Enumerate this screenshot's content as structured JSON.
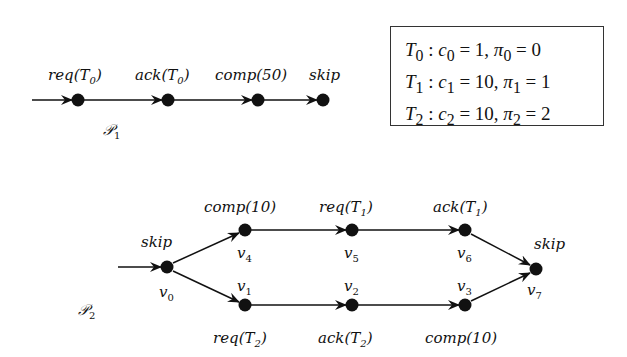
{
  "p1": {
    "title": "P",
    "title_sub": "1",
    "nodes": [
      {
        "id": "n0",
        "x": 78,
        "y": 100,
        "label": "req(T",
        "label_sub": "0",
        "label_end": ")"
      },
      {
        "id": "n1",
        "x": 168,
        "y": 100,
        "label": "ack(T",
        "label_sub": "0",
        "label_end": ")"
      },
      {
        "id": "n2",
        "x": 258,
        "y": 100,
        "label": "comp(50)",
        "label_sub": "",
        "label_end": ""
      },
      {
        "id": "n3",
        "x": 323,
        "y": 100,
        "label": "skip",
        "label_sub": "",
        "label_end": ""
      }
    ],
    "edges": [
      [
        "start",
        "n0"
      ],
      [
        "n0",
        "n1"
      ],
      [
        "n1",
        "n2"
      ],
      [
        "n2",
        "n3"
      ]
    ]
  },
  "legend": {
    "lines": [
      {
        "task": "T",
        "task_sub": "0",
        "c": "c",
        "c_sub": "0",
        "c_val": "1",
        "pi_sub": "0",
        "pi_val": "0"
      },
      {
        "task": "T",
        "task_sub": "1",
        "c": "c",
        "c_sub": "1",
        "c_val": "10",
        "pi_sub": "1",
        "pi_val": "1"
      },
      {
        "task": "T",
        "task_sub": "2",
        "c": "c",
        "c_sub": "2",
        "c_val": "10",
        "pi_sub": "2",
        "pi_val": "2"
      }
    ]
  },
  "p2": {
    "title": "P",
    "title_sub": "2",
    "nodes": [
      {
        "id": "v0",
        "x": 167,
        "y": 267,
        "name": "v",
        "name_sub": "0",
        "action": "skip"
      },
      {
        "id": "v4",
        "x": 245,
        "y": 230,
        "name": "v",
        "name_sub": "4",
        "action": "comp(10)"
      },
      {
        "id": "v5",
        "x": 352,
        "y": 230,
        "name": "v",
        "name_sub": "5",
        "action": "req(T1)"
      },
      {
        "id": "v6",
        "x": 465,
        "y": 230,
        "name": "v",
        "name_sub": "6",
        "action": "ack(T1)"
      },
      {
        "id": "v1",
        "x": 245,
        "y": 305,
        "name": "v",
        "name_sub": "1",
        "action": "req(T2)"
      },
      {
        "id": "v2",
        "x": 352,
        "y": 305,
        "name": "v",
        "name_sub": "2",
        "action": "ack(T2)"
      },
      {
        "id": "v3",
        "x": 465,
        "y": 305,
        "name": "v",
        "name_sub": "3",
        "action": "comp(10)"
      },
      {
        "id": "v7",
        "x": 536,
        "y": 269,
        "name": "v",
        "name_sub": "7",
        "action": "skip"
      }
    ],
    "edges": [
      [
        "start",
        "v0"
      ],
      [
        "v0",
        "v4"
      ],
      [
        "v4",
        "v5"
      ],
      [
        "v5",
        "v6"
      ],
      [
        "v6",
        "v7"
      ],
      [
        "v0",
        "v1"
      ],
      [
        "v1",
        "v2"
      ],
      [
        "v2",
        "v3"
      ],
      [
        "v3",
        "v7"
      ]
    ]
  }
}
